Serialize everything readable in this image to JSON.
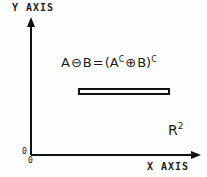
{
  "figure": {
    "background_color": "#fefefe",
    "ink_color": "#1a1a1a",
    "y_axis_label": "Y AXIS",
    "x_axis_label": "X AXIS",
    "origin_label_left": "0",
    "origin_label_bottom": "0",
    "plane_label": {
      "base": "R",
      "exponent": "2"
    },
    "formula": {
      "left_operand": "A",
      "erosion_operator": "⊖",
      "right_operand": "B",
      "equals": "=",
      "open_paren": "(",
      "complement_operand": "A",
      "complement_exponent_1": "C",
      "dilation_operator": "⊕",
      "second_operand": "B",
      "close_paren": ")",
      "complement_exponent_2": "C",
      "full_text": "A ⊖ B = (A^C ⊕ B)^C"
    },
    "set_region": {
      "name": "eroded-set-rectangle",
      "fill": "#ffffff",
      "stroke": "#111111"
    }
  }
}
